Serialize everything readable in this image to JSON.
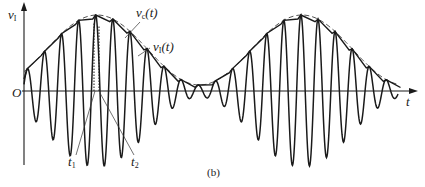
{
  "figure": {
    "caption": "(b)",
    "axis": {
      "y_label_main": "v",
      "y_label_sub": "I",
      "x_label": "t",
      "origin_label": "O"
    },
    "curves": {
      "envelope_label_main": "v",
      "envelope_label_sub": "c",
      "envelope_label_arg": "(t)",
      "output_label_main": "v",
      "output_label_sub": "I",
      "output_label_arg": "(t)"
    },
    "markers": {
      "t1_main": "t",
      "t1_sub": "1",
      "t2_main": "t",
      "t2_sub": "2"
    },
    "colors": {
      "ink": "#1a1a1a",
      "envelope": "#555555"
    }
  },
  "chart_data": {
    "type": "line",
    "title": "",
    "xlabel": "t",
    "ylabel": "v_I",
    "series": [
      {
        "name": "AM carrier (input)",
        "description": "amplitude-modulated sinusoid, ~22 cycles over two modulation periods"
      },
      {
        "name": "v_c(t)",
        "description": "dashed envelope, two maxima with a minimum between"
      },
      {
        "name": "v_I(t)",
        "description": "stepped detector output following envelope"
      }
    ],
    "annotations": [
      "t1",
      "t2",
      "(b)",
      "O"
    ],
    "grid": false
  }
}
